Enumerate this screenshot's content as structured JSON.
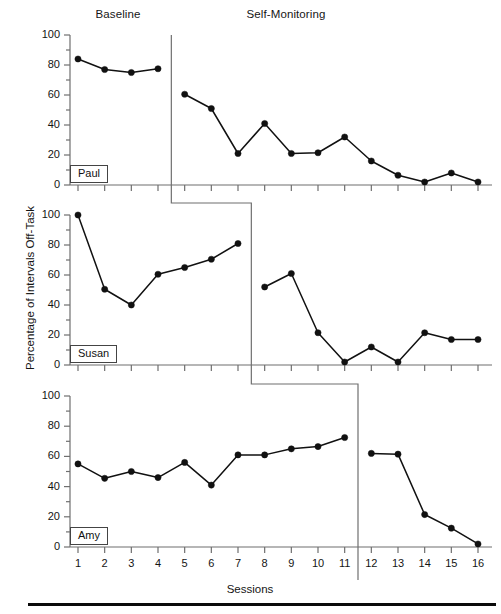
{
  "figure": {
    "headers": {
      "baseline": "Baseline",
      "treatment": "Self-Monitoring"
    },
    "axis_titles": {
      "y": "Percentage of Intervals Off-Task",
      "x": "Sessions"
    },
    "y_ticks": [
      "0",
      "20",
      "40",
      "60",
      "80",
      "100"
    ],
    "x_ticks": [
      "1",
      "2",
      "3",
      "4",
      "5",
      "6",
      "7",
      "8",
      "9",
      "10",
      "11",
      "12",
      "13",
      "14",
      "15",
      "16"
    ],
    "panels": [
      {
        "name_label": "Paul"
      },
      {
        "name_label": "Susan"
      },
      {
        "name_label": "Amy"
      }
    ]
  },
  "chart_data": {
    "type": "line",
    "title": "",
    "subtitle": "",
    "xlabel": "Sessions",
    "ylabel": "Percentage of Intervals Off-Task",
    "xlim": [
      0.4,
      16.6
    ],
    "ylim": [
      0,
      100
    ],
    "y_ticks_major": [
      0,
      20,
      40,
      60,
      80,
      100
    ],
    "y_ticks_minor_step": 10,
    "x": [
      1,
      2,
      3,
      4,
      5,
      6,
      7,
      8,
      9,
      10,
      11,
      12,
      13,
      14,
      15,
      16
    ],
    "grid": false,
    "legend": "none",
    "marker": "filled-circle",
    "line_color": "#111111",
    "marker_color": "#111111",
    "phase_labels": [
      "Baseline",
      "Self-Monitoring"
    ],
    "design": "multiple-baseline-across-participants",
    "panels": [
      {
        "label": "Paul",
        "phase_change_after_session": 4,
        "phase_line_x": 4.5,
        "series": [
          {
            "name": "Baseline",
            "x": [
              1,
              2,
              3,
              4
            ],
            "values": [
              84,
              77,
              75,
              77.5
            ]
          },
          {
            "name": "Self-Monitoring",
            "x": [
              5,
              6,
              7,
              8,
              9,
              10,
              11,
              12,
              13,
              14,
              15,
              16
            ],
            "values": [
              60.5,
              51,
              21,
              41,
              21,
              21.5,
              32,
              16,
              6.5,
              2,
              8,
              2
            ]
          }
        ]
      },
      {
        "label": "Susan",
        "phase_change_after_session": 7,
        "phase_line_x": 7.5,
        "series": [
          {
            "name": "Baseline",
            "x": [
              1,
              2,
              3,
              4,
              5,
              6,
              7
            ],
            "values": [
              100,
              50.5,
              40,
              60.5,
              65,
              70.5,
              81
            ]
          },
          {
            "name": "Self-Monitoring",
            "x": [
              8,
              9,
              10,
              11,
              12,
              13,
              14,
              15,
              16
            ],
            "values": [
              52,
              61,
              21.5,
              2,
              12,
              2,
              21.5,
              17,
              17
            ]
          }
        ]
      },
      {
        "label": "Amy",
        "phase_change_after_session": 11,
        "phase_line_x": 11.5,
        "series": [
          {
            "name": "Baseline",
            "x": [
              1,
              2,
              3,
              4,
              5,
              6,
              7,
              8,
              9,
              10,
              11
            ],
            "values": [
              55,
              45.5,
              50,
              46,
              56,
              41,
              61,
              61,
              65,
              66.5,
              72.5
            ]
          },
          {
            "name": "Self-Monitoring",
            "x": [
              12,
              13,
              14,
              15,
              16
            ],
            "values": [
              62,
              61.5,
              21.5,
              12.5,
              2
            ]
          }
        ]
      }
    ]
  }
}
